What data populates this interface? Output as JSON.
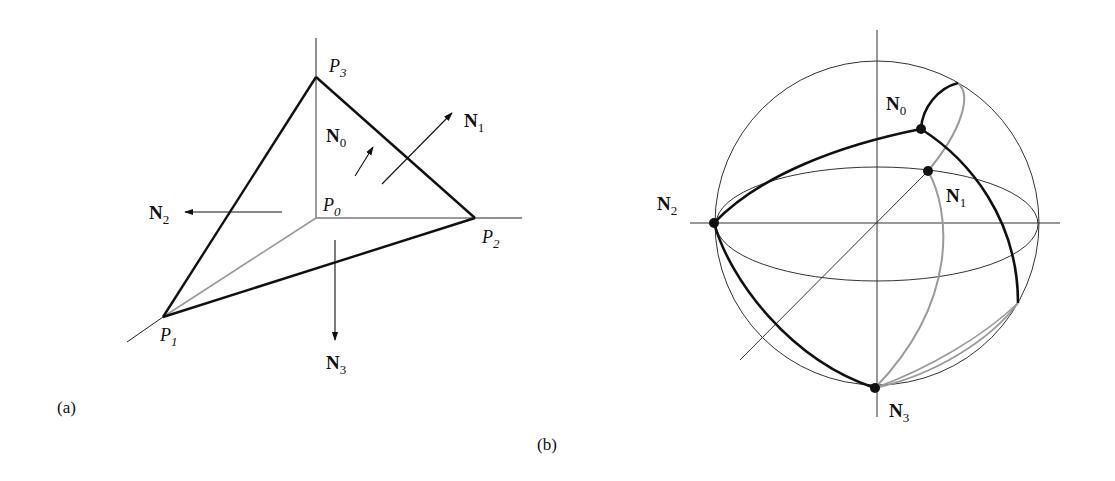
{
  "figure": {
    "panel_a": {
      "caption": "(a)",
      "description": "Tetrahedron with vertices P0..P3 on coordinate axes and outward face normals N0..N3",
      "vertices": [
        {
          "name": "P0",
          "base": "P",
          "sub": "0"
        },
        {
          "name": "P1",
          "base": "P",
          "sub": "1"
        },
        {
          "name": "P2",
          "base": "P",
          "sub": "2"
        },
        {
          "name": "P3",
          "base": "P",
          "sub": "3"
        }
      ],
      "normals": [
        {
          "name": "N0",
          "base": "N",
          "sub": "0"
        },
        {
          "name": "N1",
          "base": "N",
          "sub": "1"
        },
        {
          "name": "N2",
          "base": "N",
          "sub": "2"
        },
        {
          "name": "N3",
          "base": "N",
          "sub": "3"
        }
      ]
    },
    "panel_b": {
      "caption": "(b)",
      "description": "Unit sphere with normals N0..N3 as points joined by great-circle arcs",
      "points": [
        {
          "name": "N0",
          "base": "N",
          "sub": "0"
        },
        {
          "name": "N1",
          "base": "N",
          "sub": "1"
        },
        {
          "name": "N2",
          "base": "N",
          "sub": "2"
        },
        {
          "name": "N3",
          "base": "N",
          "sub": "3"
        }
      ]
    },
    "colors": {
      "ink": "#111111",
      "gray_edge": "#9a9a9a",
      "thin_line": "#333333"
    }
  }
}
